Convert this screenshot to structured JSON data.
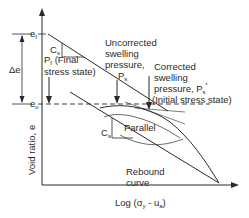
{
  "diagram": {
    "type": "void-ratio vs log stress swelling pressure diagram",
    "axes": {
      "x_label": "Log (σ",
      "x_label_sub": "y",
      "x_label_mid": " - u",
      "x_label_sub2": "a",
      "x_label_end": ")",
      "y_label": "Void ratio, e"
    },
    "levels": {
      "ef": "e",
      "ef_sub": "f",
      "eo": "e",
      "eo_sub": "o",
      "delta_e": "Δe"
    },
    "labels": {
      "cs_top": "C",
      "cs_top_sub": "s",
      "cs_bottom": "C",
      "cs_bottom_sub": "s",
      "pf_line1": "P",
      "pf_line1_sub": "f",
      "pf_line1_rest": " (Final",
      "pf_line2": "stress state)",
      "uncorrected_line1": "Uncorrected",
      "uncorrected_line2": "swelling",
      "uncorrected_line3": "pressure,",
      "uncorrected_ps": "P",
      "uncorrected_ps_sub": "s",
      "corrected_line1": "Corrected",
      "corrected_line2": "swelling",
      "corrected_line3": "pressure, P",
      "corrected_line3_sub": "s",
      "corrected_prime": "'",
      "corrected_line4": "(Initial stress state)",
      "parallel": "Parallel",
      "rebound_line1": "Rebound",
      "rebound_line2": "curve"
    }
  }
}
